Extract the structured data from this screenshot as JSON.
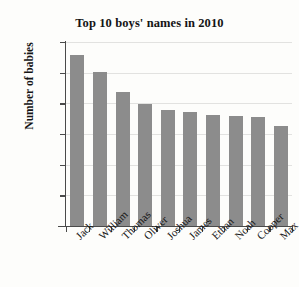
{
  "chart_data": {
    "type": "bar",
    "title": "Top 10 boys' names in 2010",
    "xlabel": "",
    "ylabel": "Number of babies",
    "categories": [
      "Jack",
      "William",
      "Thomas",
      "Oliver",
      "Joshua",
      "James",
      "Ethan",
      "Noah",
      "Cooper",
      "Max"
    ],
    "values": [
      557,
      503,
      436,
      397,
      378,
      372,
      361,
      359,
      357,
      325
    ],
    "ylim": [
      0,
      600
    ],
    "ytick_labels": [
      "0",
      "100",
      "200",
      "300",
      "400",
      "500",
      "600"
    ],
    "ytick_values": [
      0,
      100,
      200,
      300,
      400,
      500,
      600
    ],
    "grid": true,
    "legend": "none",
    "series": [
      {
        "name": "Number of babies",
        "color": "#8c8c8c",
        "values": [
          557,
          503,
          436,
          397,
          378,
          372,
          361,
          359,
          357,
          325
        ]
      }
    ]
  },
  "style": {
    "bar_color": "#8c8c8c",
    "axis_color": "#4a4a4a",
    "gridline_color": "#e2e2e0",
    "background_color": "#fdfdfb",
    "text_color": "#161616"
  }
}
